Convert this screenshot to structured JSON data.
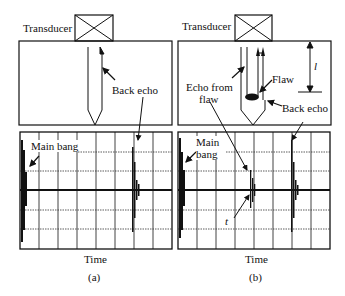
{
  "panel_a": {
    "transducer_label": "Transducer",
    "back_echo_label": "Back echo",
    "main_bang_label": "Main bang",
    "x_axis_label": "Time",
    "caption": "(a)"
  },
  "panel_b": {
    "transducer_label": "Transducer",
    "flaw_label": "Flaw",
    "echo_from_flaw_label_line1": "Echo from",
    "echo_from_flaw_label_line2": "flaw",
    "back_echo_label": "Back echo",
    "main_bang_label_line1": "Main",
    "main_bang_label_line2": "bang",
    "depth_label": "l",
    "time_label": "t",
    "x_axis_label": "Time",
    "caption": "(b)"
  }
}
